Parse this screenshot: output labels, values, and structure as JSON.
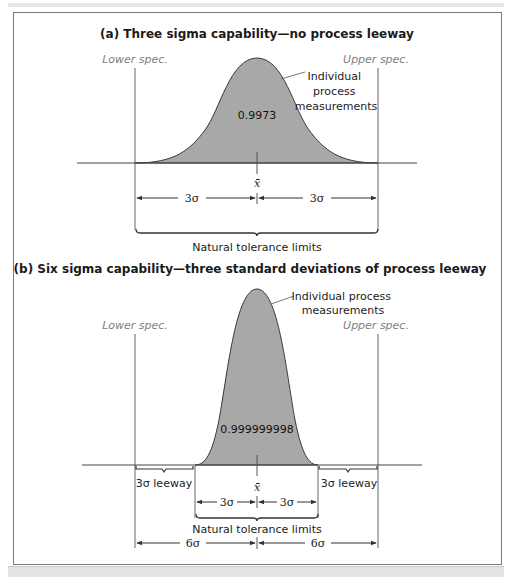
{
  "figure": {
    "panel_a": {
      "title": "(a) Three sigma capability—no process leeway",
      "lower_spec": "Lower spec.",
      "upper_spec": "Upper spec.",
      "curve_label_lines": [
        "Individual",
        "process",
        "measurements"
      ],
      "area_value": "0.9973",
      "mean_symbol": "x̄̄",
      "left_span": "3σ",
      "right_span": "3σ",
      "brace_label": "Natural tolerance limits"
    },
    "panel_b": {
      "title": "(b) Six sigma capability—three standard deviations of process leeway",
      "lower_spec": "Lower spec.",
      "upper_spec": "Upper spec.",
      "curve_label_lines": [
        "Individual process",
        "measurements"
      ],
      "area_value": "0.999999998",
      "mean_symbol": "x̄̄",
      "left_leeway": "3σ leeway",
      "right_leeway": "3σ leeway",
      "inner_left_span": "3σ",
      "inner_right_span": "3σ",
      "brace_label": "Natural tolerance limits",
      "outer_left_span": "6σ",
      "outer_right_span": "6σ"
    },
    "colors": {
      "curve_fill": "#a8a8a8",
      "curve_stroke": "#3a3a3a",
      "spec_label": "#808080",
      "frame": "#7a7a7a"
    }
  }
}
